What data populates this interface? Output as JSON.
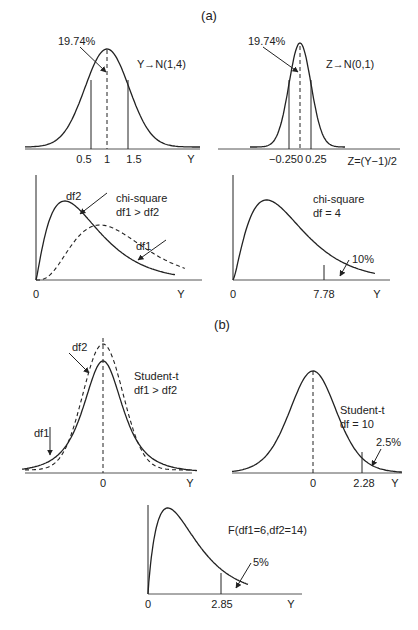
{
  "sections": {
    "a": "(a)",
    "b": "(b)"
  },
  "panels": {
    "normal_y": {
      "title": "Y→N(1,4)",
      "annotation": "19.74%",
      "ticks": [
        "0.5",
        "1",
        "1.5"
      ],
      "axis_label": "Y"
    },
    "normal_z": {
      "title": "Z→N(0,1)",
      "annotation": "19.74%",
      "ticks": [
        "−0.25",
        "0",
        "0.25"
      ],
      "axis_label": "Z=(Y−1)/2"
    },
    "chisq_compare": {
      "title_line1": "chi-square",
      "title_line2": "df1 > df2",
      "curve_labels": [
        "df2",
        "df1"
      ],
      "origin": "0",
      "axis_label": "Y"
    },
    "chisq_df4": {
      "title_line1": "chi-square",
      "title_line2": "df = 4",
      "annotation": "10%",
      "origin": "0",
      "tick": "7.78",
      "axis_label": "Y"
    },
    "t_compare": {
      "title_line1": "Student-t",
      "title_line2": "df1 > df2",
      "curve_labels": [
        "df2",
        "df1"
      ],
      "tick": "0",
      "axis_label": "Y"
    },
    "t_df10": {
      "title_line1": "Student-t",
      "title_line2": "df = 10",
      "annotation": "2.5%",
      "tick0": "0",
      "tick": "2.28",
      "axis_label": "Y"
    },
    "f_dist": {
      "title": "F(df1=6,df2=14)",
      "annotation": "5%",
      "origin": "0",
      "tick": "2.85",
      "axis_label": "Y"
    }
  }
}
